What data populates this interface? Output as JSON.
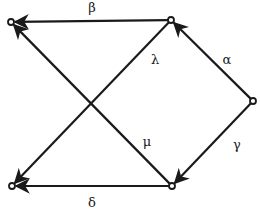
{
  "diagram": {
    "type": "directed-graph",
    "nodes": [
      {
        "id": "top_left",
        "label": ""
      },
      {
        "id": "top_right",
        "label": ""
      },
      {
        "id": "right",
        "label": ""
      },
      {
        "id": "bottom_right",
        "label": ""
      },
      {
        "id": "bottom_left",
        "label": ""
      }
    ],
    "edges": [
      {
        "id": "beta",
        "label": "β",
        "from": "top_right",
        "to": "top_left"
      },
      {
        "id": "alpha",
        "label": "α",
        "from": "right",
        "to": "top_right"
      },
      {
        "id": "lambda",
        "label": "λ",
        "from": "top_right",
        "to": "bottom_left"
      },
      {
        "id": "mu",
        "label": "μ",
        "from": "bottom_right",
        "to": "top_left"
      },
      {
        "id": "gamma",
        "label": "γ",
        "from": "right",
        "to": "bottom_right"
      },
      {
        "id": "delta",
        "label": "δ",
        "from": "bottom_right",
        "to": "bottom_left"
      }
    ],
    "colors": {
      "line": "#1a1a1a",
      "background": "#ffffff"
    }
  }
}
